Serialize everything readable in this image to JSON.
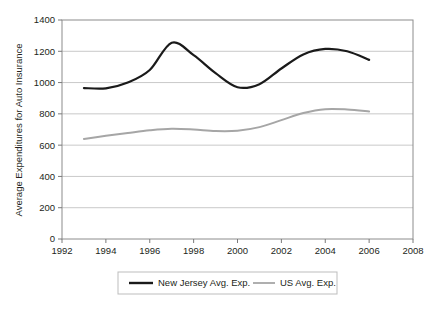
{
  "chart_data": {
    "type": "line",
    "title": "",
    "subtitle": "",
    "xlabel": "",
    "ylabel": "Average Expenditures for Auto Insurance",
    "xlim": [
      1992,
      2008
    ],
    "ylim": [
      0,
      1400
    ],
    "xticks": [
      1992,
      1994,
      1996,
      1998,
      2000,
      2002,
      2004,
      2006,
      2008
    ],
    "yticks": [
      0,
      200,
      400,
      600,
      800,
      1000,
      1200,
      1400
    ],
    "xtick_labels": [
      "1992",
      "1994",
      "1996",
      "1998",
      "2000",
      "2002",
      "2004",
      "2006",
      "2008"
    ],
    "ytick_labels": [
      "0",
      "200",
      "400",
      "600",
      "800",
      "1000",
      "1200",
      "1400"
    ],
    "grid": "horizontal",
    "legend_position": "bottom",
    "x": [
      1993,
      1994,
      1995,
      1996,
      1997,
      1998,
      1999,
      2000,
      2001,
      2002,
      2003,
      2004,
      2005,
      2006
    ],
    "series": [
      {
        "name": "New Jersey Avg. Exp.",
        "color": "#1a1a1a",
        "values": [
          965,
          963,
          1000,
          1080,
          1255,
          1175,
          1060,
          970,
          990,
          1090,
          1180,
          1215,
          1200,
          1145
        ]
      },
      {
        "name": "US Avg. Exp.",
        "color": "#a6a6a6",
        "values": [
          640,
          660,
          678,
          695,
          705,
          700,
          690,
          692,
          715,
          760,
          805,
          830,
          828,
          815
        ]
      }
    ]
  },
  "legend": {
    "items": [
      {
        "label": "New Jersey Avg. Exp.",
        "color": "#1a1a1a"
      },
      {
        "label": "US Avg. Exp.",
        "color": "#a6a6a6"
      }
    ]
  },
  "axes": {
    "y_title": "Average Expenditures for Auto Insurance"
  },
  "colors": {
    "new_jersey": "#1a1a1a",
    "us": "#a6a6a6",
    "gridline": "#c9c9c9",
    "axis": "#7a7a7a",
    "text": "#231f20",
    "legend_border": "#bdbdbd",
    "background": "#ffffff"
  }
}
